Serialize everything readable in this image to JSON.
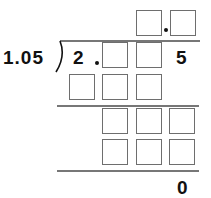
{
  "puzzle": {
    "type": "long-division",
    "divisor": "1.05",
    "dividend_prefix": "2",
    "dividend_suffix": "5",
    "remainder": "0",
    "quotient": {
      "boxes": 2,
      "has_decimal_point": true
    },
    "dividend": {
      "boxes": 2,
      "has_decimal_point": true
    },
    "rows": [
      {
        "name": "subtract-1",
        "boxes": 3
      },
      {
        "name": "bring-down-1",
        "boxes": 3
      },
      {
        "name": "subtract-2",
        "boxes": 3
      }
    ],
    "colors": {
      "box_border": "#6e6e6e",
      "line": "#777777",
      "text": "#111111"
    }
  }
}
